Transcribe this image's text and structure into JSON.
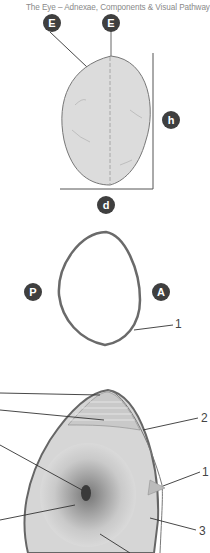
{
  "header": {
    "title": "The Eye – Adnexae, Components & Visual Pathway"
  },
  "figure_top": {
    "badges": [
      {
        "id": "E1",
        "label": "E"
      },
      {
        "id": "E2",
        "label": "E"
      },
      {
        "id": "h",
        "label": "h"
      },
      {
        "id": "d",
        "label": "d"
      }
    ],
    "description": "Lens outer view with equator lines, height h and diameter d"
  },
  "figure_middle": {
    "badges": [
      {
        "id": "P",
        "label": "P"
      },
      {
        "id": "A",
        "label": "A"
      }
    ],
    "callouts": [
      {
        "label": "1"
      }
    ],
    "description": "Lens cross-section outline with posterior (P) and anterior (A) poles"
  },
  "figure_bottom": {
    "callouts": [
      {
        "label": "2"
      },
      {
        "label": "1"
      },
      {
        "label": "3"
      }
    ],
    "description": "Lens section detail with capsule, zonular fibres, nucleus and cortex"
  },
  "colors": {
    "badge": "#3f3f3f",
    "lens_fill": "#d9d9d9",
    "capsule": "#6e6e6e",
    "text_muted": "#8a8a8a"
  }
}
